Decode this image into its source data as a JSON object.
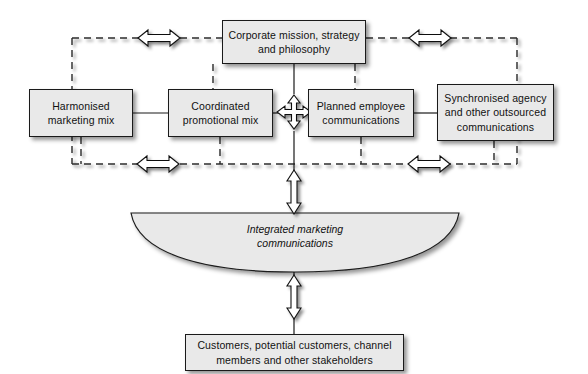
{
  "diagram": {
    "colors": {
      "node_fill": "#e9e9e9",
      "node_stroke": "#1a1a1a",
      "dashed_line": "#2b2b2b",
      "arrow_fill": "#ffffff",
      "arrow_stroke": "#111111",
      "background": "#ffffff"
    },
    "nodes": {
      "mission": "Corporate mission, strategy\nand philosophy",
      "harmonised_marketing_mix": "Harmonised\nmarketing mix",
      "coordinated_promotional_mix": "Coordinated\npromotional mix",
      "planned_employee_communications": "Planned employee\ncommunications",
      "synchronised_agency": "Synchronised agency\nand other outsourced\ncommunications",
      "integrated_marketing_communications": "Integrated marketing\ncommunications",
      "customers": "Customers, potential customers, channel\nmembers and other stakeholders"
    },
    "connectors": {
      "four_way_arrow": "four-way-arrow",
      "double_arrow_horizontal": "double-headed-horizontal-arrow",
      "double_arrow_vertical": "double-headed-vertical-arrow",
      "dashed_feedback_loop": "dashed-feedback-loop"
    }
  }
}
